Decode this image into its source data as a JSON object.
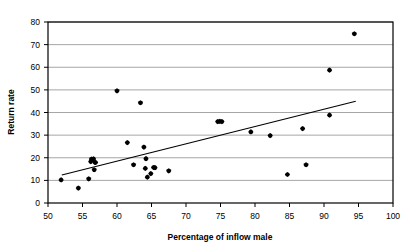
{
  "chart_data": {
    "type": "scatter",
    "title": "",
    "xlabel": "Percentage of inflow male",
    "ylabel": "Return rate",
    "xlim": [
      50,
      100
    ],
    "ylim": [
      0,
      80
    ],
    "xticks": [
      50,
      55,
      60,
      65,
      70,
      75,
      80,
      85,
      90,
      95,
      100
    ],
    "yticks": [
      0,
      10,
      20,
      30,
      40,
      50,
      60,
      70,
      80
    ],
    "xtick_labels": [
      "50",
      "55",
      "60",
      "65",
      "70",
      "75",
      "80",
      "85",
      "90",
      "95",
      "100"
    ],
    "ytick_labels": [
      "0",
      "10",
      "20",
      "30",
      "40",
      "50",
      "60",
      "70",
      "80"
    ],
    "grid": "horizontal",
    "grid_color": "#808080",
    "frame_color": "#000000",
    "marker": "diamond",
    "marker_color": "#000000",
    "legend": "none",
    "points": [
      {
        "x": 51.9,
        "y": 10.2
      },
      {
        "x": 54.4,
        "y": 6.6
      },
      {
        "x": 55.9,
        "y": 10.7
      },
      {
        "x": 56.2,
        "y": 18.3
      },
      {
        "x": 56.3,
        "y": 19.4
      },
      {
        "x": 56.6,
        "y": 19.5
      },
      {
        "x": 56.8,
        "y": 18.0
      },
      {
        "x": 56.9,
        "y": 17.9
      },
      {
        "x": 56.7,
        "y": 14.7
      },
      {
        "x": 60.0,
        "y": 49.6
      },
      {
        "x": 61.5,
        "y": 26.7
      },
      {
        "x": 62.4,
        "y": 16.9
      },
      {
        "x": 63.4,
        "y": 44.3
      },
      {
        "x": 63.9,
        "y": 24.7
      },
      {
        "x": 64.1,
        "y": 15.3
      },
      {
        "x": 64.2,
        "y": 19.6
      },
      {
        "x": 64.4,
        "y": 11.4
      },
      {
        "x": 64.9,
        "y": 13.0
      },
      {
        "x": 65.3,
        "y": 15.7
      },
      {
        "x": 65.5,
        "y": 15.6
      },
      {
        "x": 67.5,
        "y": 14.2
      },
      {
        "x": 74.6,
        "y": 36.0
      },
      {
        "x": 74.9,
        "y": 36.1
      },
      {
        "x": 75.2,
        "y": 36.0
      },
      {
        "x": 79.4,
        "y": 31.4
      },
      {
        "x": 82.2,
        "y": 29.8
      },
      {
        "x": 84.7,
        "y": 12.6
      },
      {
        "x": 86.9,
        "y": 32.9
      },
      {
        "x": 87.4,
        "y": 16.9
      },
      {
        "x": 90.8,
        "y": 38.8
      },
      {
        "x": 90.8,
        "y": 58.7
      },
      {
        "x": 94.4,
        "y": 74.8
      }
    ],
    "trendline": {
      "x0": 52.0,
      "y0": 12.4,
      "x1": 94.6,
      "y1": 45.0,
      "color": "#000000"
    }
  }
}
